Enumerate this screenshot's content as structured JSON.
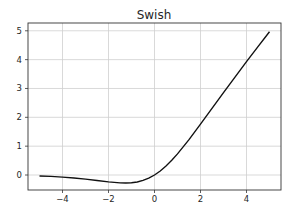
{
  "chart_data": {
    "type": "line",
    "title": "Swish",
    "xlabel": "",
    "ylabel": "",
    "xlim": [
      -5.5,
      5.5
    ],
    "ylim": [
      -0.52,
      5.27
    ],
    "grid": true,
    "legend": null,
    "xticks": [
      -4,
      -2,
      0,
      2,
      4
    ],
    "xtick_labels": [
      "−4",
      "−2",
      "0",
      "2",
      "4"
    ],
    "yticks": [
      0,
      1,
      2,
      3,
      4,
      5
    ],
    "ytick_labels": [
      "0",
      "1",
      "2",
      "3",
      "4",
      "5"
    ],
    "series": [
      {
        "name": "swish",
        "color": "#111111",
        "x": [
          -5,
          -4.5,
          -4,
          -3.5,
          -3,
          -2.5,
          -2,
          -1.5,
          -1.25,
          -1,
          -0.75,
          -0.5,
          -0.25,
          0,
          0.25,
          0.5,
          0.75,
          1,
          1.5,
          2,
          2.5,
          3,
          3.5,
          4,
          4.5,
          5
        ],
        "y": [
          -0.0335,
          -0.0492,
          -0.0719,
          -0.1029,
          -0.1423,
          -0.1896,
          -0.2384,
          -0.2736,
          -0.2785,
          -0.2689,
          -0.2416,
          -0.1888,
          -0.1097,
          0.0,
          0.1403,
          0.3112,
          0.5084,
          0.7311,
          1.2264,
          1.7616,
          2.3096,
          2.8577,
          3.3924,
          3.9281,
          4.4502,
          4.9665
        ]
      }
    ]
  }
}
